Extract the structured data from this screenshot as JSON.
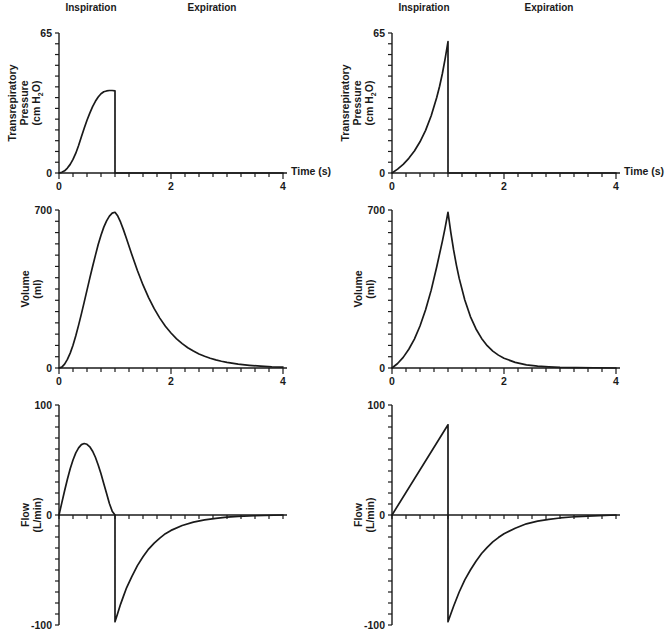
{
  "figure": {
    "background": "#ffffff",
    "ink_color": "#1a1a1a"
  },
  "labels": {
    "inspiration": "Inspiration",
    "expiration": "Expiration",
    "time_axis": "Time (s)",
    "pressure_ylabel": {
      "line1": "Transrepiratory",
      "line2": "Pressure",
      "unit_prefix": "(cm H",
      "unit_sub": "2",
      "unit_suffix": "O)"
    },
    "volume_ylabel": {
      "line1": "Volume",
      "line2": "(ml)"
    },
    "flow_ylabel": {
      "line1": "Flow",
      "line2": "(L/min)"
    }
  },
  "chart_data": [
    {
      "type": "line",
      "id": "pressure-left",
      "title": "",
      "xlabel": "Time (s)",
      "ylabel": "Transrepiratory Pressure (cm H2O)",
      "xlim": [
        0,
        4
      ],
      "ylim": [
        0,
        65
      ],
      "minor_x_step": 0.25,
      "minor_y_step": 5,
      "xticks": [
        {
          "v": 0,
          "t": "0"
        },
        {
          "v": 2,
          "t": "2"
        },
        {
          "v": 4,
          "t": "4"
        }
      ],
      "yticks": [
        {
          "v": 65,
          "t": "65"
        },
        {
          "v": 0,
          "t": "0"
        }
      ],
      "series": [
        {
          "name": "transrespiratory-pressure",
          "points": [
            [
              0,
              0
            ],
            [
              0.05,
              0.3
            ],
            [
              0.1,
              1
            ],
            [
              0.15,
              2.3
            ],
            [
              0.2,
              4
            ],
            [
              0.25,
              6.3
            ],
            [
              0.3,
              9.2
            ],
            [
              0.35,
              12.8
            ],
            [
              0.4,
              16.8
            ],
            [
              0.45,
              20.8
            ],
            [
              0.5,
              24.5
            ],
            [
              0.55,
              27.8
            ],
            [
              0.6,
              30.8
            ],
            [
              0.65,
              33.3
            ],
            [
              0.7,
              35.3
            ],
            [
              0.75,
              36.8
            ],
            [
              0.8,
              37.7
            ],
            [
              0.85,
              38.1
            ],
            [
              0.9,
              38.3
            ],
            [
              0.95,
              38.3
            ],
            [
              1,
              38.1
            ],
            [
              1,
              0
            ],
            [
              4,
              0
            ]
          ]
        }
      ]
    },
    {
      "type": "line",
      "id": "pressure-right",
      "title": "",
      "xlabel": "Time (s)",
      "ylabel": "Transrepiratory Pressure (cm H2O)",
      "xlim": [
        0,
        4
      ],
      "ylim": [
        0,
        65
      ],
      "minor_x_step": 0.25,
      "minor_y_step": 5,
      "xticks": [
        {
          "v": 0,
          "t": "0"
        },
        {
          "v": 2,
          "t": "2"
        },
        {
          "v": 4,
          "t": "4"
        }
      ],
      "yticks": [
        {
          "v": 65,
          "t": "65"
        },
        {
          "v": 0,
          "t": "0"
        }
      ],
      "series": [
        {
          "name": "transrespiratory-pressure",
          "points": [
            [
              0,
              0
            ],
            [
              0.1,
              1.8
            ],
            [
              0.2,
              4
            ],
            [
              0.3,
              6.8
            ],
            [
              0.4,
              10.2
            ],
            [
              0.5,
              14.5
            ],
            [
              0.6,
              19.8
            ],
            [
              0.7,
              26.6
            ],
            [
              0.8,
              35.2
            ],
            [
              0.85,
              40.3
            ],
            [
              0.9,
              46.2
            ],
            [
              0.95,
              53.2
            ],
            [
              1,
              61
            ],
            [
              1,
              0
            ],
            [
              4,
              0
            ]
          ]
        }
      ]
    },
    {
      "type": "line",
      "id": "volume-left",
      "title": "",
      "xlabel": "",
      "ylabel": "Volume (ml)",
      "xlim": [
        0,
        4
      ],
      "ylim": [
        0,
        700
      ],
      "minor_x_step": 0.25,
      "minor_y_step": 50,
      "xticks": [
        {
          "v": 0,
          "t": "0"
        },
        {
          "v": 2,
          "t": "2"
        },
        {
          "v": 4,
          "t": "4"
        }
      ],
      "yticks": [
        {
          "v": 700,
          "t": "700"
        },
        {
          "v": 0,
          "t": "0"
        }
      ],
      "series": [
        {
          "name": "volume",
          "points": [
            [
              0,
              0
            ],
            [
              0.05,
              4
            ],
            [
              0.1,
              17
            ],
            [
              0.15,
              38
            ],
            [
              0.2,
              66
            ],
            [
              0.25,
              101
            ],
            [
              0.3,
              143
            ],
            [
              0.35,
              190
            ],
            [
              0.4,
              240
            ],
            [
              0.45,
              292
            ],
            [
              0.5,
              345
            ],
            [
              0.55,
              398
            ],
            [
              0.6,
              450
            ],
            [
              0.65,
              499
            ],
            [
              0.7,
              547
            ],
            [
              0.75,
              588
            ],
            [
              0.8,
              624
            ],
            [
              0.85,
              652
            ],
            [
              0.9,
              673
            ],
            [
              0.95,
              686
            ],
            [
              1,
              690
            ],
            [
              1.05,
              673
            ],
            [
              1.1,
              646
            ],
            [
              1.15,
              613
            ],
            [
              1.2,
              577
            ],
            [
              1.3,
              503
            ],
            [
              1.4,
              432
            ],
            [
              1.5,
              368
            ],
            [
              1.6,
              312
            ],
            [
              1.7,
              263
            ],
            [
              1.8,
              221
            ],
            [
              1.9,
              185
            ],
            [
              2,
              155
            ],
            [
              2.1,
              129
            ],
            [
              2.2,
              108
            ],
            [
              2.3,
              90
            ],
            [
              2.4,
              75
            ],
            [
              2.5,
              62
            ],
            [
              2.6,
              52
            ],
            [
              2.7,
              43
            ],
            [
              2.8,
              36
            ],
            [
              2.9,
              30
            ],
            [
              3,
              25
            ],
            [
              3.2,
              17
            ],
            [
              3.4,
              12
            ],
            [
              3.6,
              8
            ],
            [
              3.8,
              5
            ],
            [
              4,
              4
            ]
          ]
        }
      ]
    },
    {
      "type": "line",
      "id": "volume-right",
      "title": "",
      "xlabel": "",
      "ylabel": "Volume (ml)",
      "xlim": [
        0,
        4
      ],
      "ylim": [
        0,
        700
      ],
      "minor_x_step": 0.25,
      "minor_y_step": 50,
      "xticks": [
        {
          "v": 0,
          "t": "0"
        },
        {
          "v": 2,
          "t": "2"
        },
        {
          "v": 4,
          "t": "4"
        }
      ],
      "yticks": [
        {
          "v": 700,
          "t": "700"
        },
        {
          "v": 0,
          "t": "0"
        }
      ],
      "series": [
        {
          "name": "volume",
          "points": [
            [
              0,
              0
            ],
            [
              0.1,
              20
            ],
            [
              0.2,
              47
            ],
            [
              0.3,
              83
            ],
            [
              0.4,
              128
            ],
            [
              0.5,
              186
            ],
            [
              0.6,
              258
            ],
            [
              0.7,
              345
            ],
            [
              0.8,
              450
            ],
            [
              0.9,
              562
            ],
            [
              0.95,
              623
            ],
            [
              1,
              690
            ],
            [
              1.05,
              601
            ],
            [
              1.1,
              523
            ],
            [
              1.15,
              456
            ],
            [
              1.2,
              397
            ],
            [
              1.3,
              301
            ],
            [
              1.4,
              228
            ],
            [
              1.5,
              173
            ],
            [
              1.6,
              131
            ],
            [
              1.7,
              99
            ],
            [
              1.8,
              75
            ],
            [
              1.9,
              57
            ],
            [
              2,
              43
            ],
            [
              2.2,
              25
            ],
            [
              2.4,
              14
            ],
            [
              2.6,
              8
            ],
            [
              2.8,
              5
            ],
            [
              3,
              3
            ],
            [
              3.3,
              2
            ],
            [
              3.6,
              1
            ],
            [
              4,
              0
            ]
          ]
        }
      ]
    },
    {
      "type": "line",
      "id": "flow-left",
      "title": "",
      "xlabel": "",
      "ylabel": "Flow (L/min)",
      "xlim": [
        0,
        4
      ],
      "ylim": [
        -100,
        100
      ],
      "minor_x_step": 0.25,
      "minor_y_step": 10,
      "xticks": [],
      "yticks": [
        {
          "v": 100,
          "t": "100"
        },
        {
          "v": 0,
          "t": "0"
        },
        {
          "v": -100,
          "t": "-100"
        }
      ],
      "series": [
        {
          "name": "flow",
          "points": [
            [
              0,
              0
            ],
            [
              0.05,
              11
            ],
            [
              0.1,
              22
            ],
            [
              0.15,
              32.5
            ],
            [
              0.2,
              42
            ],
            [
              0.25,
              50
            ],
            [
              0.3,
              56.5
            ],
            [
              0.35,
              61
            ],
            [
              0.4,
              64
            ],
            [
              0.45,
              65
            ],
            [
              0.5,
              64.3
            ],
            [
              0.55,
              62
            ],
            [
              0.6,
              58
            ],
            [
              0.65,
              52.5
            ],
            [
              0.7,
              45.5
            ],
            [
              0.75,
              37.5
            ],
            [
              0.8,
              28.5
            ],
            [
              0.85,
              19.5
            ],
            [
              0.9,
              10.5
            ],
            [
              0.95,
              3.5
            ],
            [
              1,
              0
            ],
            [
              1,
              -97
            ],
            [
              1.05,
              -89
            ],
            [
              1.1,
              -81
            ],
            [
              1.15,
              -74
            ],
            [
              1.2,
              -67
            ],
            [
              1.3,
              -56
            ],
            [
              1.4,
              -46
            ],
            [
              1.5,
              -38
            ],
            [
              1.6,
              -31
            ],
            [
              1.7,
              -25.5
            ],
            [
              1.8,
              -21
            ],
            [
              1.9,
              -17
            ],
            [
              2,
              -14
            ],
            [
              2.2,
              -9.5
            ],
            [
              2.4,
              -6.5
            ],
            [
              2.6,
              -4.5
            ],
            [
              2.8,
              -3
            ],
            [
              3,
              -2
            ],
            [
              3.2,
              -1.3
            ],
            [
              3.5,
              -0.7
            ],
            [
              4,
              0
            ]
          ]
        }
      ]
    },
    {
      "type": "line",
      "id": "flow-right",
      "title": "",
      "xlabel": "",
      "ylabel": "Flow (L/min)",
      "xlim": [
        0,
        4
      ],
      "ylim": [
        -100,
        100
      ],
      "minor_x_step": 0.25,
      "minor_y_step": 10,
      "xticks": [],
      "yticks": [
        {
          "v": 100,
          "t": "100"
        },
        {
          "v": 0,
          "t": "0"
        },
        {
          "v": -100,
          "t": "-100"
        }
      ],
      "series": [
        {
          "name": "flow",
          "points": [
            [
              0,
              0
            ],
            [
              1,
              82
            ],
            [
              1,
              -97
            ],
            [
              1.05,
              -90
            ],
            [
              1.1,
              -83
            ],
            [
              1.2,
              -70
            ],
            [
              1.3,
              -59
            ],
            [
              1.4,
              -50
            ],
            [
              1.5,
              -42
            ],
            [
              1.6,
              -35
            ],
            [
              1.7,
              -29.5
            ],
            [
              1.8,
              -24.5
            ],
            [
              1.9,
              -20.5
            ],
            [
              2,
              -17
            ],
            [
              2.2,
              -12
            ],
            [
              2.4,
              -8
            ],
            [
              2.6,
              -5.5
            ],
            [
              2.8,
              -4
            ],
            [
              3,
              -2.7
            ],
            [
              3.2,
              -1.8
            ],
            [
              3.5,
              -1
            ],
            [
              4,
              0
            ]
          ]
        }
      ]
    }
  ]
}
